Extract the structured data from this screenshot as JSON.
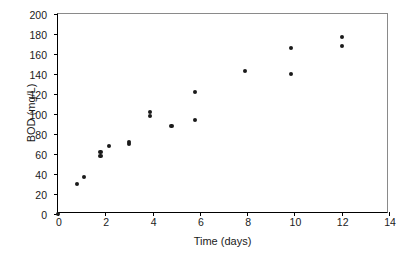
{
  "chart_data": {
    "type": "scatter",
    "title": "",
    "xlabel": "Time (days)",
    "ylabel": "BOD (mg/L)",
    "xlim": [
      0,
      14
    ],
    "ylim": [
      0,
      200
    ],
    "xticks": [
      0,
      2,
      4,
      6,
      8,
      10,
      12,
      14
    ],
    "yticks": [
      0,
      20,
      40,
      60,
      80,
      100,
      120,
      140,
      160,
      180,
      200
    ],
    "grid": false,
    "legend": null,
    "marker": {
      "shape": "circle",
      "color": "#1a1a1a",
      "size_px": 4.2
    },
    "series": [
      {
        "name": "BOD",
        "points": [
          {
            "x": 0.0,
            "y": 0
          },
          {
            "x": 0.8,
            "y": 30
          },
          {
            "x": 1.1,
            "y": 37
          },
          {
            "x": 1.8,
            "y": 58
          },
          {
            "x": 1.8,
            "y": 62
          },
          {
            "x": 2.15,
            "y": 68
          },
          {
            "x": 3.0,
            "y": 70
          },
          {
            "x": 3.0,
            "y": 72
          },
          {
            "x": 3.9,
            "y": 98
          },
          {
            "x": 3.9,
            "y": 102
          },
          {
            "x": 4.8,
            "y": 88
          },
          {
            "x": 5.8,
            "y": 94
          },
          {
            "x": 5.8,
            "y": 122
          },
          {
            "x": 7.9,
            "y": 143
          },
          {
            "x": 9.85,
            "y": 140
          },
          {
            "x": 9.85,
            "y": 166
          },
          {
            "x": 12.0,
            "y": 168
          },
          {
            "x": 12.0,
            "y": 177
          }
        ]
      }
    ]
  },
  "axes": {
    "x_tick_labels": [
      "0",
      "2",
      "4",
      "6",
      "8",
      "10",
      "12",
      "14"
    ],
    "y_tick_labels": [
      "0",
      "20",
      "40",
      "60",
      "80",
      "100",
      "120",
      "140",
      "160",
      "180",
      "200"
    ],
    "x_axis_title": "Time (days)",
    "y_axis_title": "BOD (mg/L)"
  }
}
